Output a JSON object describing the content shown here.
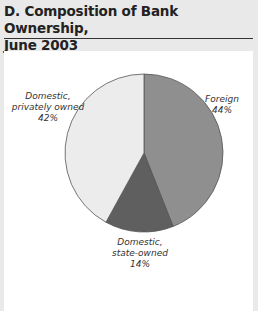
{
  "title_line1": "D. Composition of Bank Ownership,",
  "title_line2": "June 2003",
  "chart_data": {
    "type": "pie",
    "title": "Composition of Bank Ownership, June 2003",
    "start_angle": "12 o'clock, clockwise",
    "categories": [
      "Foreign",
      "Domestic, state-owned",
      "Domestic, privately owned"
    ],
    "values": [
      44,
      14,
      42
    ],
    "unit": "%",
    "colors": [
      "#8f8f8f",
      "#5f5f5f",
      "#ececec"
    ],
    "labels": [
      {
        "line1": "Foreign",
        "line2": "44%"
      },
      {
        "line1": "Domestic,",
        "line2": "state-owned",
        "line3": "14%"
      },
      {
        "line1": "Domestic,",
        "line2": "privately owned",
        "line3": "42%"
      }
    ]
  },
  "source_text": ""
}
